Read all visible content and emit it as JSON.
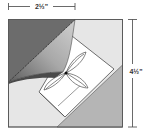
{
  "diagram": {
    "dimensions": {
      "width_label": "2½\"",
      "height_label": "4½\""
    },
    "colors": {
      "dark_fabric": "#6f6f6f",
      "mid_fabric": "#9a9a9a",
      "light_fabric": "#e8e8e8",
      "medium_light_fabric": "#b9b9b9",
      "line": "#333333",
      "background": "#ffffff"
    },
    "parts": [
      "dark corner triangle (top-left)",
      "folded-back flap with curved edge",
      "light square background",
      "on-point white center square",
      "three-petal flower",
      "grey corner triangle (bottom-right)"
    ]
  }
}
